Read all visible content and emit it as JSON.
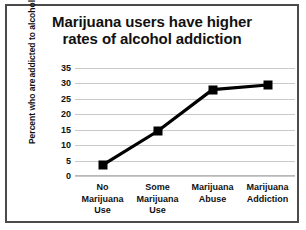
{
  "chart_data": {
    "type": "line",
    "title": "Marijuana users have higher rates of alcohol addiction",
    "title_line1": "Marijuana users have higher",
    "title_line2": "rates of alcohol addiction",
    "categories": [
      "No Marijuana Use",
      "Some Marijuana Use",
      "Marijuana Abuse",
      "Marijuana Addiction"
    ],
    "category_lines": [
      [
        "No",
        "Marijuana",
        "Use"
      ],
      [
        "Some",
        "Marijuana",
        "Use"
      ],
      [
        "Marijuana",
        "Abuse"
      ],
      [
        "Marijuana",
        "Addiction"
      ]
    ],
    "values": [
      3.5,
      14.5,
      28,
      29.5
    ],
    "xlabel": "",
    "ylabel": "Percent who are addicted to alcohol",
    "ylabel_line1": "Percent who are",
    "ylabel_line2": "addicted to alcohol",
    "ylim": [
      0,
      35
    ],
    "ytick_step": 5,
    "yticks": [
      35,
      30,
      25,
      20,
      15,
      10,
      5,
      0
    ],
    "grid": true,
    "legend": "none",
    "series_color": "#000000",
    "marker": "square",
    "gridline_color": "#c9c9c9",
    "background_color": "#ffffff",
    "border_color": "#4a4a4a"
  }
}
